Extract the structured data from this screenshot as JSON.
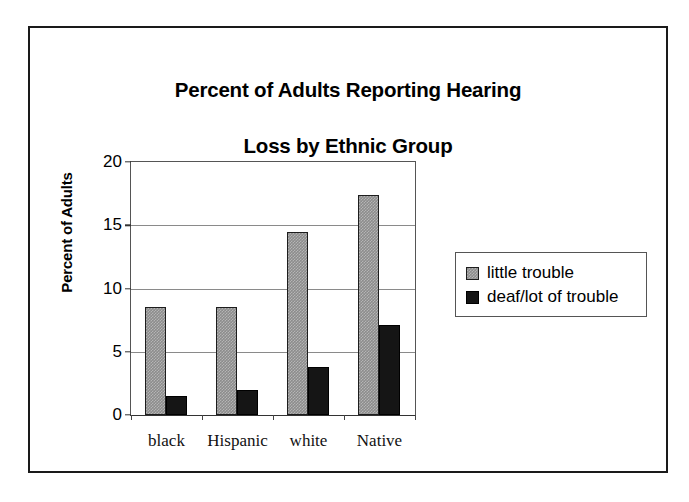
{
  "chart_data": {
    "type": "bar",
    "title": "Percent of Adults Reporting Hearing\nLoss by Ethnic Group",
    "title_line1": "Percent of Adults Reporting Hearing",
    "title_line2": "Loss by Ethnic Group",
    "xlabel": "",
    "ylabel": "Percent of Adults",
    "ylim": [
      0,
      20
    ],
    "yticks": [
      0,
      5,
      10,
      15,
      20
    ],
    "ytick_labels": [
      "0",
      "5",
      "10",
      "15",
      "20"
    ],
    "grid": true,
    "grid_axis": "y",
    "legend_position": "right",
    "categories": [
      "black",
      "Hispanic",
      "white",
      "Native"
    ],
    "series": [
      {
        "name": "little trouble",
        "color": "#8c8c8c",
        "values": [
          8.5,
          8.5,
          14.5,
          17.4
        ]
      },
      {
        "name": "deaf/lot of trouble",
        "color": "#151515",
        "values": [
          1.5,
          2.0,
          3.8,
          7.1
        ]
      }
    ]
  },
  "legend": {
    "items": [
      {
        "label": "little trouble"
      },
      {
        "label": "deaf/lot of trouble"
      }
    ]
  },
  "colors": {
    "series_little_trouble": "#8c8c8c",
    "series_deaf_lot_of_trouble": "#151515",
    "gridline": "#8a8a8a",
    "axis": "#333333",
    "frame": "#1a1a1a",
    "text": "#000000"
  }
}
